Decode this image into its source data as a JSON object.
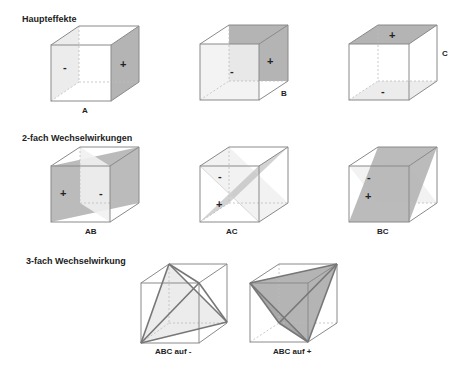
{
  "sections": {
    "main_effects": "Haupteffekte",
    "two_way": "2-fach Wechselwirkungen",
    "three_way": "3-fach Wechselwirkung"
  },
  "cubes": {
    "A": {
      "label": "A",
      "plus": "+",
      "minus": "-"
    },
    "B": {
      "label": "B",
      "plus": "+",
      "minus": "-"
    },
    "C": {
      "label": "C",
      "plus": "+",
      "minus": "-"
    },
    "AB": {
      "label": "AB",
      "plus": "+",
      "minus": "-"
    },
    "AC": {
      "label": "AC",
      "plus": "+",
      "minus": "-"
    },
    "BC": {
      "label": "BC",
      "plus": "+",
      "minus": "-"
    },
    "ABC_minus": {
      "label": "ABC auf -"
    },
    "ABC_plus": {
      "label": "ABC auf +"
    }
  },
  "colors": {
    "edge": "#8a8a8a",
    "shade_dark": "#b4b4b4",
    "shade_light": "#ececec",
    "text": "#222222"
  }
}
